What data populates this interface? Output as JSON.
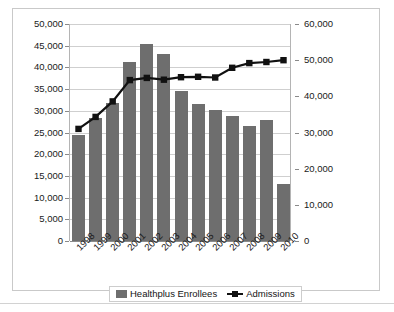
{
  "chart_data": {
    "type": "bar",
    "title": "",
    "subtitle": "",
    "xlabel": "",
    "ylabel": "",
    "grid": true,
    "legend_position": "bottom",
    "categories": [
      "1998",
      "1999",
      "2000",
      "2001",
      "2002",
      "2003",
      "2004",
      "2005",
      "2006",
      "2007",
      "2008",
      "2009",
      "2010"
    ],
    "axes": {
      "left": {
        "label": "",
        "min": 0,
        "max": 50000,
        "step": 5000,
        "ticks": [
          "0",
          "5,000",
          "10,000",
          "15,000",
          "20,000",
          "25,000",
          "30,000",
          "35,000",
          "40,000",
          "45,000",
          "50,000"
        ],
        "tick_values": [
          0,
          5000,
          10000,
          15000,
          20000,
          25000,
          30000,
          35000,
          40000,
          45000,
          50000
        ]
      },
      "right": {
        "label": "",
        "min": 0,
        "max": 60000,
        "step": 10000,
        "ticks": [
          "0",
          "10,000",
          "20,000",
          "30,000",
          "40,000",
          "50,000",
          "60,000"
        ],
        "tick_values": [
          0,
          10000,
          20000,
          30000,
          40000,
          50000,
          60000
        ]
      }
    },
    "series": [
      {
        "name": "Healthplus Enrollees",
        "type": "bar",
        "axis": "left",
        "color": "#6e6e6e",
        "values": [
          24500,
          28300,
          31800,
          41300,
          45300,
          43200,
          34500,
          31500,
          30100,
          28900,
          26600,
          27900,
          13200
        ]
      },
      {
        "name": "Admissions",
        "type": "line",
        "axis": "right",
        "color": "#111111",
        "marker": "square",
        "values": [
          31000,
          34300,
          38600,
          44500,
          45100,
          44600,
          45300,
          45400,
          45200,
          47900,
          49200,
          49500,
          50000
        ]
      }
    ]
  },
  "legend": {
    "items": [
      {
        "label": "Healthplus Enrollees",
        "marker": "bar-swatch"
      },
      {
        "label": "Admissions",
        "marker": "line-square-swatch"
      }
    ]
  }
}
